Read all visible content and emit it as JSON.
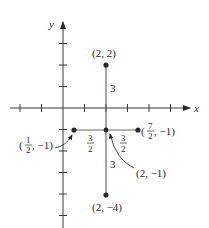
{
  "axes": {
    "x_label": "x",
    "y_label": "y",
    "x_ticks": [
      -2,
      -1,
      1,
      2,
      3,
      4,
      5
    ],
    "y_ticks": [
      3,
      2,
      1,
      -1,
      -2,
      -3,
      -4,
      -5
    ]
  },
  "segments": [
    {
      "from": [
        2,
        2
      ],
      "to": [
        2,
        -4
      ]
    },
    {
      "from": [
        0.5,
        -1
      ],
      "to": [
        3.5,
        -1
      ]
    }
  ],
  "points": [
    {
      "x": 2,
      "y": 2,
      "label": "(2, 2)"
    },
    {
      "x": 2,
      "y": -4,
      "label": "(2, −4)"
    },
    {
      "x": 0.5,
      "y": -1,
      "label_open": "(",
      "label_num": "1",
      "label_den": "2",
      "label_close": ", −1)"
    },
    {
      "x": 3.5,
      "y": -1,
      "label_open": "(",
      "label_num": "7",
      "label_den": "2",
      "label_close": ", −1)"
    },
    {
      "x": 2,
      "y": -1,
      "label": "(2, −1)"
    }
  ],
  "distance_labels": {
    "upper": "3",
    "lower": "3",
    "left_num": "3",
    "left_den": "2",
    "right_num": "3",
    "right_den": "2"
  }
}
